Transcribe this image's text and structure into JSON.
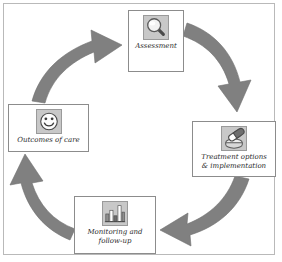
{
  "diagram": {
    "type": "cycle",
    "direction": "clockwise",
    "frame_color": "#b9b9b9",
    "arrow_color": "#808080",
    "icon_fill": "#c8c8c8",
    "background": "#ffffff",
    "nodes": [
      {
        "id": "assessment",
        "label": "Assessment",
        "icon": "magnifier-icon",
        "position": "top"
      },
      {
        "id": "treatment",
        "label": "Treatment options\n& implementation",
        "icon": "pill-capsule-icon",
        "position": "right"
      },
      {
        "id": "monitoring",
        "label": "Monitoring and\nfollow-up",
        "icon": "bar-chart-icon",
        "position": "bottom"
      },
      {
        "id": "outcomes",
        "label": "Outcomes of care",
        "icon": "smiley-face-icon",
        "position": "left"
      }
    ],
    "arrows": [
      {
        "id": "outcomes-to-assessment",
        "from": "outcomes",
        "to": "assessment"
      },
      {
        "id": "assessment-to-treatment",
        "from": "assessment",
        "to": "treatment"
      },
      {
        "id": "treatment-to-monitoring",
        "from": "treatment",
        "to": "monitoring"
      },
      {
        "id": "monitoring-to-outcomes",
        "from": "monitoring",
        "to": "outcomes"
      }
    ]
  }
}
